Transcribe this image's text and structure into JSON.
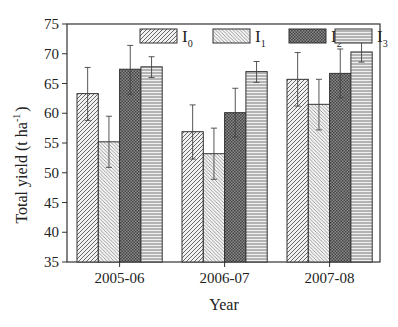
{
  "chart_data": {
    "type": "bar",
    "title": "",
    "xlabel": "Year",
    "ylabel": "Total yield (t ha-1)",
    "ylabel_main": "Total yield (t ha",
    "ylabel_sup": "-1",
    "ylabel_close": ")",
    "ylim": [
      35,
      75
    ],
    "yticks": [
      35,
      40,
      45,
      50,
      55,
      60,
      65,
      70,
      75
    ],
    "categories": [
      "2005-06",
      "2006-07",
      "2007-08"
    ],
    "grid": false,
    "legend_position": "top-inside",
    "series": [
      {
        "name": "I0",
        "base": "I",
        "sub": "0",
        "pattern": "diag-right",
        "values": [
          63.3,
          56.9,
          65.7
        ],
        "err_high": [
          67.7,
          61.4,
          70.2
        ],
        "err_low": [
          58.8,
          52.3,
          61.2
        ]
      },
      {
        "name": "I1",
        "base": "I",
        "sub": "1",
        "pattern": "diag-left",
        "values": [
          55.2,
          53.2,
          61.5
        ],
        "err_high": [
          59.5,
          57.5,
          65.7
        ],
        "err_low": [
          50.9,
          48.9,
          57.2
        ]
      },
      {
        "name": "I2",
        "base": "I",
        "sub": "2",
        "pattern": "crosshatch",
        "values": [
          67.4,
          60.1,
          66.7
        ],
        "err_high": [
          71.4,
          64.2,
          70.8
        ],
        "err_low": [
          63.2,
          56.0,
          62.6
        ]
      },
      {
        "name": "I3",
        "base": "I",
        "sub": "3",
        "pattern": "horizontal",
        "values": [
          67.8,
          67.0,
          70.3
        ],
        "err_high": [
          69.5,
          68.7,
          72.0
        ],
        "err_low": [
          66.0,
          65.2,
          68.6
        ]
      }
    ]
  },
  "colors": {
    "axis": "#333333",
    "bar_stroke": "#333333",
    "hatch": "#555555",
    "background": "#ffffff"
  }
}
